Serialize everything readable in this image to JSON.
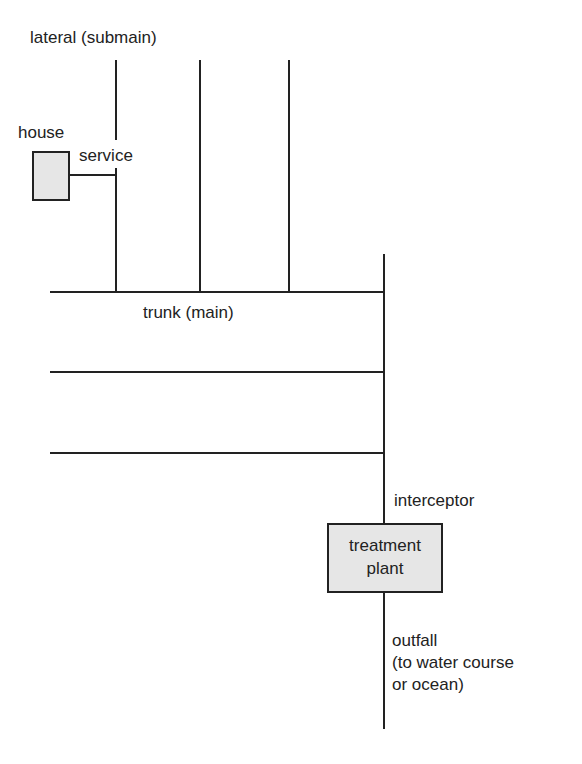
{
  "diagram": {
    "type": "sewer-system-layout",
    "labels": {
      "lateral": "lateral (submain)",
      "house": "house",
      "service": "service",
      "trunk": "trunk (main)",
      "interceptor": "interceptor",
      "plant_line1": "treatment",
      "plant_line2": "plant",
      "outfall_line1": "outfall",
      "outfall_line2": "(to water course",
      "outfall_line3": "or ocean)"
    },
    "colors": {
      "line": "#222222",
      "box_fill": "#e6e6e6",
      "background": "#ffffff"
    },
    "nodes": [
      {
        "id": "house",
        "label": "house"
      },
      {
        "id": "laterals",
        "count": 3,
        "label": "lateral (submain)"
      },
      {
        "id": "trunks",
        "count": 3,
        "label": "trunk (main)"
      },
      {
        "id": "interceptor",
        "label": "interceptor"
      },
      {
        "id": "treatment-plant",
        "label": "treatment plant"
      },
      {
        "id": "outfall",
        "label": "outfall (to water course or ocean)"
      }
    ],
    "edges": [
      {
        "from": "house",
        "to": "laterals",
        "label": "service"
      },
      {
        "from": "laterals",
        "to": "trunks"
      },
      {
        "from": "trunks",
        "to": "interceptor"
      },
      {
        "from": "interceptor",
        "to": "treatment-plant"
      },
      {
        "from": "treatment-plant",
        "to": "outfall"
      }
    ]
  }
}
